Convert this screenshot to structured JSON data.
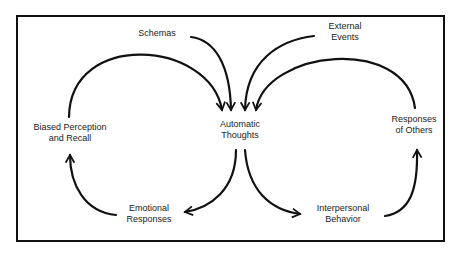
{
  "diagram": {
    "type": "cognitive-interpersonal cycle",
    "nodes": {
      "schemas": {
        "line1": "Schemas"
      },
      "external_events": {
        "line1": "External",
        "line2": "Events"
      },
      "automatic_thoughts": {
        "line1": "Automatic",
        "line2": "Thoughts"
      },
      "biased_perception": {
        "line1": "Biased Perception",
        "line2": "and Recall"
      },
      "responses_of_others": {
        "line1": "Responses",
        "line2": "of Others"
      },
      "emotional_responses": {
        "line1": "Emotional",
        "line2": "Responses"
      },
      "interpersonal_behavior": {
        "line1": "Interpersonal",
        "line2": "Behavior"
      }
    },
    "edges": [
      {
        "from": "Schemas",
        "to": "Automatic Thoughts"
      },
      {
        "from": "External Events",
        "to": "Automatic Thoughts"
      },
      {
        "from": "Biased Perception and Recall",
        "to": "Automatic Thoughts"
      },
      {
        "from": "Responses of Others",
        "to": "Automatic Thoughts"
      },
      {
        "from": "Automatic Thoughts",
        "to": "Emotional Responses"
      },
      {
        "from": "Emotional Responses",
        "to": "Biased Perception and Recall"
      },
      {
        "from": "Automatic Thoughts",
        "to": "Interpersonal Behavior"
      },
      {
        "from": "Interpersonal Behavior",
        "to": "Responses of Others"
      }
    ],
    "colors": {
      "stroke": "#111111",
      "text": "#222222",
      "background": "#ffffff"
    }
  }
}
